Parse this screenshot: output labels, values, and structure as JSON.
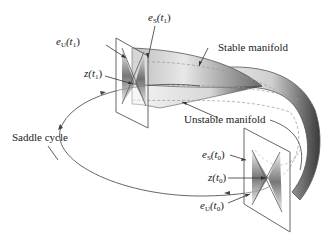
{
  "figure": {
    "labels": {
      "saddle_cycle": "Saddle cycle",
      "stable_manifold": "Stable manifold",
      "unstable_manifold": "Unstable manifold",
      "eU_t1": {
        "base": "e",
        "sub": "U",
        "arg": "(t",
        "argsub": "1",
        "close": ")"
      },
      "eS_t1": {
        "base": "e",
        "sub": "S",
        "arg": "(t",
        "argsub": "1",
        "close": ")"
      },
      "z_t1": {
        "base": "z",
        "arg": "(t",
        "argsub": "1",
        "close": ")"
      },
      "eS_t0": {
        "base": "e",
        "sub": "S",
        "arg": "(t",
        "argsub": "0",
        "close": ")"
      },
      "z_t0": {
        "base": "z",
        "arg": "(t",
        "argsub": "0",
        "close": ")"
      },
      "eU_t0": {
        "base": "e",
        "sub": "U",
        "arg": "(t",
        "argsub": "0",
        "close": ")"
      }
    },
    "colors": {
      "line": "#555555",
      "surface_dark": "#444444",
      "surface_light": "#f2f2f2",
      "dashed": "#999999"
    }
  }
}
